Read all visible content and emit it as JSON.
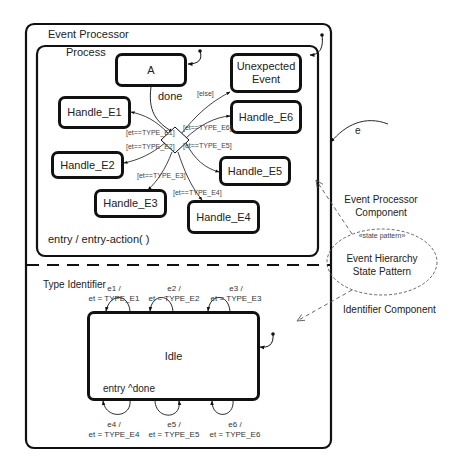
{
  "outer": {
    "title": "Event Processor",
    "process": {
      "title": "Process",
      "entry_action": "entry / entry-action( )",
      "states": [
        {
          "id": "A",
          "label": "A"
        },
        {
          "id": "unexpected",
          "label": "Unexpected Event"
        },
        {
          "id": "e6",
          "label": "Handle_E6"
        },
        {
          "id": "e1",
          "label": "Handle_E1"
        },
        {
          "id": "e2",
          "label": "Handle_E2"
        },
        {
          "id": "e5",
          "label": "Handle_E5"
        },
        {
          "id": "e3",
          "label": "Handle_E3"
        },
        {
          "id": "e4",
          "label": "Handle_E4"
        }
      ],
      "transition_done": "done",
      "guards": {
        "else": "[else]",
        "e1": "[et==TYPE_E1]",
        "e2": "[et==TYPE_E2]",
        "e3": "[et==TYPE_E3]",
        "e4": "[et==TYPE_E4]",
        "e5": "[et==TYPE_E5]",
        "e6": "[et==TYPE_E6]"
      }
    },
    "type_identifier": {
      "title": "Type Identifier",
      "idle": {
        "label": "Idle",
        "entry": "entry ^done"
      },
      "self_transitions_top": [
        {
          "event": "e1 /",
          "action": "et = TYPE_E1"
        },
        {
          "event": "e2 /",
          "action": "et = TYPE_E2"
        },
        {
          "event": "e3 /",
          "action": "et = TYPE_E3"
        }
      ],
      "self_transitions_bottom": [
        {
          "event": "e4 /",
          "action": "et = TYPE_E4"
        },
        {
          "event": "e5 /",
          "action": "et = TYPE_E5"
        },
        {
          "event": "e6 /",
          "action": "et = TYPE_E6"
        }
      ]
    }
  },
  "external": {
    "event_label": "e",
    "pattern": {
      "stereotype": "«state pattern»",
      "name_line1": "Event Hierarchy",
      "name_line2": "State Pattern"
    },
    "roles": {
      "processor_line1": "Event Processor",
      "processor_line2": "Component",
      "identifier": "Identifier Component"
    }
  }
}
